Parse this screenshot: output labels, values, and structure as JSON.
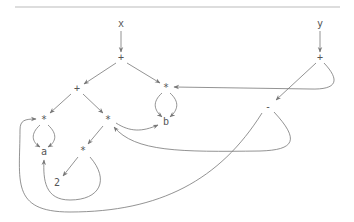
{
  "diagram": {
    "type": "expression-dag",
    "nodes": [
      {
        "id": "x",
        "label": "x"
      },
      {
        "id": "y",
        "label": "y"
      },
      {
        "id": "plus_x",
        "label": "+"
      },
      {
        "id": "plus_y",
        "label": "+"
      },
      {
        "id": "plus_inner",
        "label": "+"
      },
      {
        "id": "mul_right",
        "label": "*"
      },
      {
        "id": "mul_left",
        "label": "*"
      },
      {
        "id": "mul_mid",
        "label": "*"
      },
      {
        "id": "mul_bottom",
        "label": "*"
      },
      {
        "id": "minus",
        "label": "-"
      },
      {
        "id": "a",
        "label": "a"
      },
      {
        "id": "b",
        "label": "b"
      },
      {
        "id": "two",
        "label": "2"
      }
    ],
    "edges": [
      {
        "from": "x",
        "to": "plus_x"
      },
      {
        "from": "y",
        "to": "plus_y"
      },
      {
        "from": "plus_x",
        "to": "plus_inner"
      },
      {
        "from": "plus_x",
        "to": "mul_right"
      },
      {
        "from": "plus_y",
        "to": "mul_right"
      },
      {
        "from": "plus_y",
        "to": "minus"
      },
      {
        "from": "plus_inner",
        "to": "mul_left"
      },
      {
        "from": "plus_inner",
        "to": "mul_mid"
      },
      {
        "from": "mul_right",
        "to": "b",
        "note": "left"
      },
      {
        "from": "mul_right",
        "to": "b",
        "note": "right"
      },
      {
        "from": "mul_left",
        "to": "a",
        "note": "left"
      },
      {
        "from": "mul_left",
        "to": "a",
        "note": "right"
      },
      {
        "from": "mul_mid",
        "to": "b"
      },
      {
        "from": "mul_mid",
        "to": "mul_bottom"
      },
      {
        "from": "mul_bottom",
        "to": "two"
      },
      {
        "from": "mul_bottom",
        "to": "a"
      },
      {
        "from": "minus",
        "to": "mul_mid"
      },
      {
        "from": "minus",
        "to": "mul_left"
      }
    ]
  }
}
